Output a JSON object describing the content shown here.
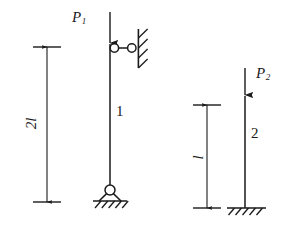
{
  "figure": {
    "background_color": "#ffffff",
    "line_color": "#1a1a1a",
    "width": 292,
    "height": 248
  },
  "bars": [
    {
      "id": "bar-1",
      "label": "1",
      "label_x": 117,
      "label_y": 112,
      "top_y": 12,
      "bottom_y": 186,
      "x": 110,
      "top_support": "horizontal-link-roller-to-wall",
      "bottom_support": "pin-support",
      "load_label": "P",
      "load_subscript": "1",
      "load_label_x": 73,
      "load_label_y": 12,
      "load_arrow_tip_y": 45
    },
    {
      "id": "bar-2",
      "label": "2",
      "label_x": 252,
      "label_y": 133,
      "top_y": 68,
      "bottom_y": 208,
      "x": 245,
      "top_support": "free-loaded-end",
      "bottom_support": "fixed-ground-hatched",
      "load_label": "P",
      "load_subscript": "2",
      "load_label_x": 258,
      "load_label_y": 68,
      "load_arrow_tip_y": 97
    }
  ],
  "dimensions": [
    {
      "id": "dim-2l",
      "label": "2l",
      "label_x": 33,
      "label_y": 124,
      "x": 47,
      "top_y": 47,
      "bottom_y": 202,
      "tick_half_width": 14,
      "rotated": true
    },
    {
      "id": "dim-l",
      "label": "l",
      "label_x": 200,
      "label_y": 156,
      "x": 207,
      "top_y": 105,
      "bottom_y": 208,
      "tick_half_width": 14,
      "rotated": true
    }
  ],
  "supports": {
    "link_support": {
      "name": "horizontal-link-support",
      "bar_pin_x": 110,
      "bar_pin_y": 48,
      "wall_pin_x": 132,
      "wall_pin_y": 48,
      "pin_radius": 4.2,
      "wall_x": 139,
      "wall_top_y": 30,
      "wall_bottom_y": 68,
      "hatch_count": 4
    },
    "pin_support": {
      "name": "pin-support",
      "pin_x": 110,
      "pin_y": 190,
      "pin_radius": 5,
      "triangle_half_base": 11,
      "ground_y": 201,
      "ground_half_width": 17,
      "hatch_count": 5
    },
    "fixed_base": {
      "name": "fixed-ground-support",
      "x": 245,
      "ground_y": 208,
      "ground_left": 227,
      "ground_right": 266,
      "hatch_count": 5
    }
  },
  "icons": {
    "arrow_down": "arrow-down-icon",
    "pin_circle": "pin-circle-icon",
    "hatch": "hatch-icon"
  }
}
